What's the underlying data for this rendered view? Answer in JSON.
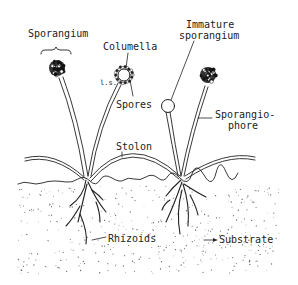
{
  "diagram": {
    "colors": {
      "ink": "#222222",
      "background": "#ffffff",
      "substrate_dots": "#666666"
    },
    "labels": {
      "sporangium": "Sporangium",
      "columella": "Columella",
      "ls": "l.s.",
      "spores": "Spores",
      "immature_line1": "Immature",
      "immature_line2": "sporangium",
      "sporangiophore_line1": "Sporangio-",
      "sporangiophore_line2": "phore",
      "stolon": "Stolon",
      "rhizoids": "Rhizoids",
      "substrate": "Substrate"
    }
  }
}
